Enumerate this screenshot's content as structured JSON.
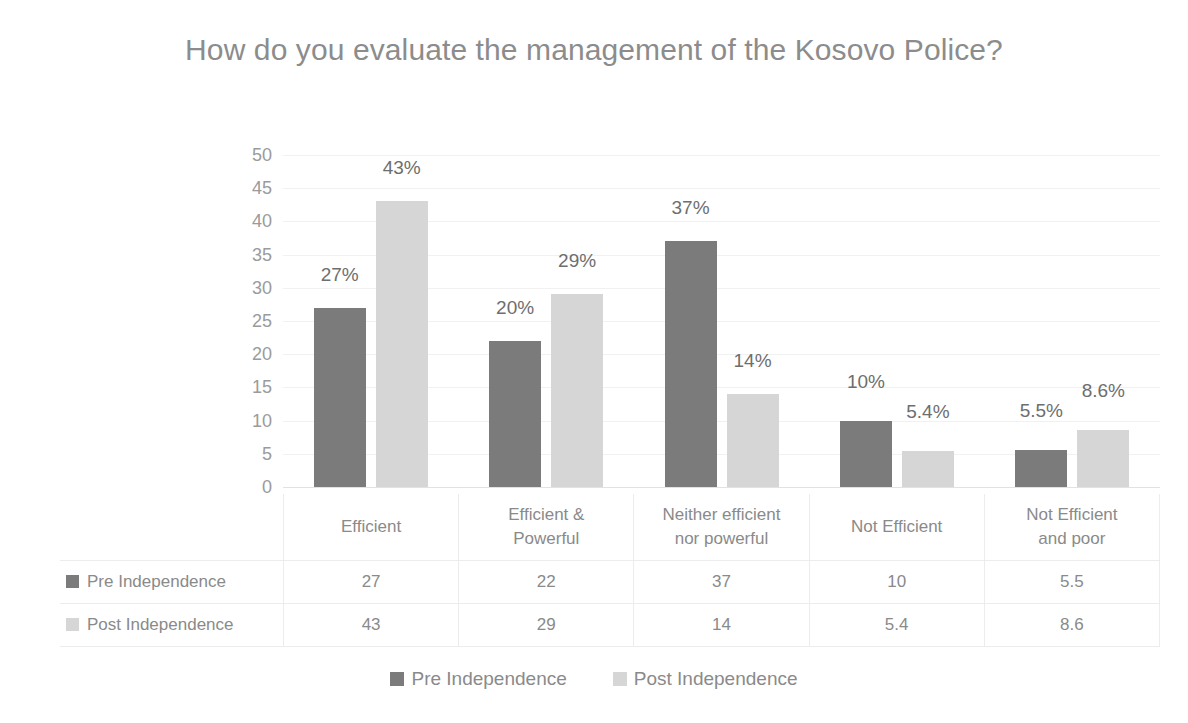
{
  "chart_data": {
    "type": "bar",
    "title": "How do you evaluate the management of the Kosovo Police?",
    "xlabel": "",
    "ylabel": "",
    "ylim": [
      0,
      50
    ],
    "ytick_step": 5,
    "yticks": [
      "50",
      "45",
      "40",
      "35",
      "30",
      "25",
      "20",
      "15",
      "10",
      "5",
      "0"
    ],
    "grid": true,
    "legend_position": "bottom",
    "categories": [
      "Efficient",
      "Efficient & Powerful",
      "Neither efficient nor powerful",
      "Not Efficient",
      "Not Efficient and poor"
    ],
    "category_lines": [
      [
        "Efficient"
      ],
      [
        "Efficient &",
        "Powerful"
      ],
      [
        "Neither efficient",
        "nor powerful"
      ],
      [
        "Not Efficient"
      ],
      [
        "Not Efficient",
        "and poor"
      ]
    ],
    "series": [
      {
        "name": "Pre Independence",
        "color": "#7b7b7b",
        "values": [
          27,
          22,
          37,
          10,
          5.5
        ],
        "labels": [
          "27%",
          "20%",
          "37%",
          "10%",
          "5.5%"
        ]
      },
      {
        "name": "Post Independence",
        "color": "#d6d6d6",
        "values": [
          43,
          29,
          14,
          5.4,
          8.6
        ],
        "labels": [
          "43%",
          "29%",
          "14%",
          "5.4%",
          "8.6%"
        ]
      }
    ]
  },
  "table": {
    "row_labels": [
      "Pre Independence",
      "Post Independence"
    ],
    "rows": [
      [
        "27",
        "22",
        "37",
        "10",
        "5.5"
      ],
      [
        "43",
        "29",
        "14",
        "5.4",
        "8.6"
      ]
    ]
  },
  "legend": {
    "items": [
      {
        "label": "Pre Independence",
        "color": "#7b7b7b"
      },
      {
        "label": "Post Independence",
        "color": "#d6d6d6"
      }
    ]
  },
  "colors": {
    "background": "#ffffff",
    "title": "#8c8c8c",
    "text": "#8a8a8a",
    "gridline": "#f1f1f1",
    "table_border": "#ececec"
  }
}
